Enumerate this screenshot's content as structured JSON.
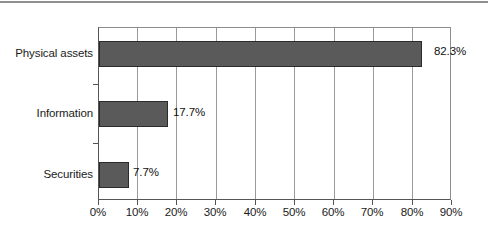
{
  "chart_data": {
    "type": "bar",
    "orientation": "horizontal",
    "title": "",
    "subtitle": "",
    "xlabel": "",
    "ylabel": "",
    "categories": [
      "Physical assets",
      "Information",
      "Securities"
    ],
    "values": [
      82.3,
      17.7,
      7.7
    ],
    "value_labels": [
      "82.3%",
      "17.7%",
      "7.7%"
    ],
    "xlim": [
      0,
      90
    ],
    "xticks": [
      0,
      10,
      20,
      30,
      40,
      50,
      60,
      70,
      80,
      90
    ],
    "xtick_labels": [
      "0%",
      "10%",
      "20%",
      "30%",
      "40%",
      "50%",
      "60%",
      "70%",
      "80%",
      "90%"
    ],
    "grid": "vertical",
    "legend": "none",
    "series": [
      {
        "name": "",
        "values": [
          82.3,
          17.7,
          7.7
        ]
      }
    ],
    "colors": {
      "bar_fill": "#5a5a5a",
      "bar_border": "#2b2b2b",
      "gridline": "#9a9a9a",
      "axis": "#555555",
      "background": "#ffffff",
      "text": "#1a1a1a",
      "top_rule": "#8f8f8f"
    }
  }
}
